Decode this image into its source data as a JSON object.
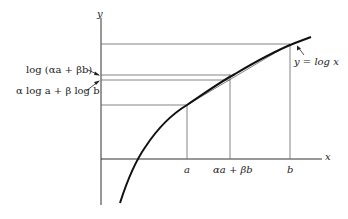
{
  "diagram": {
    "axes": {
      "x_label": "x",
      "y_label": "y"
    },
    "curve_label": "y = log x",
    "x_ticks": [
      {
        "id": "a",
        "label": "a"
      },
      {
        "id": "mid",
        "label": "αa + βb"
      },
      {
        "id": "b",
        "label": "b"
      }
    ],
    "y_annotations": [
      {
        "id": "log_mix",
        "label": "log (αa + βb)"
      },
      {
        "id": "mix_log",
        "label": "α log a + β log b"
      }
    ],
    "colors": {
      "curve": "#111111",
      "lines": "#555555",
      "text": "#222222"
    }
  }
}
